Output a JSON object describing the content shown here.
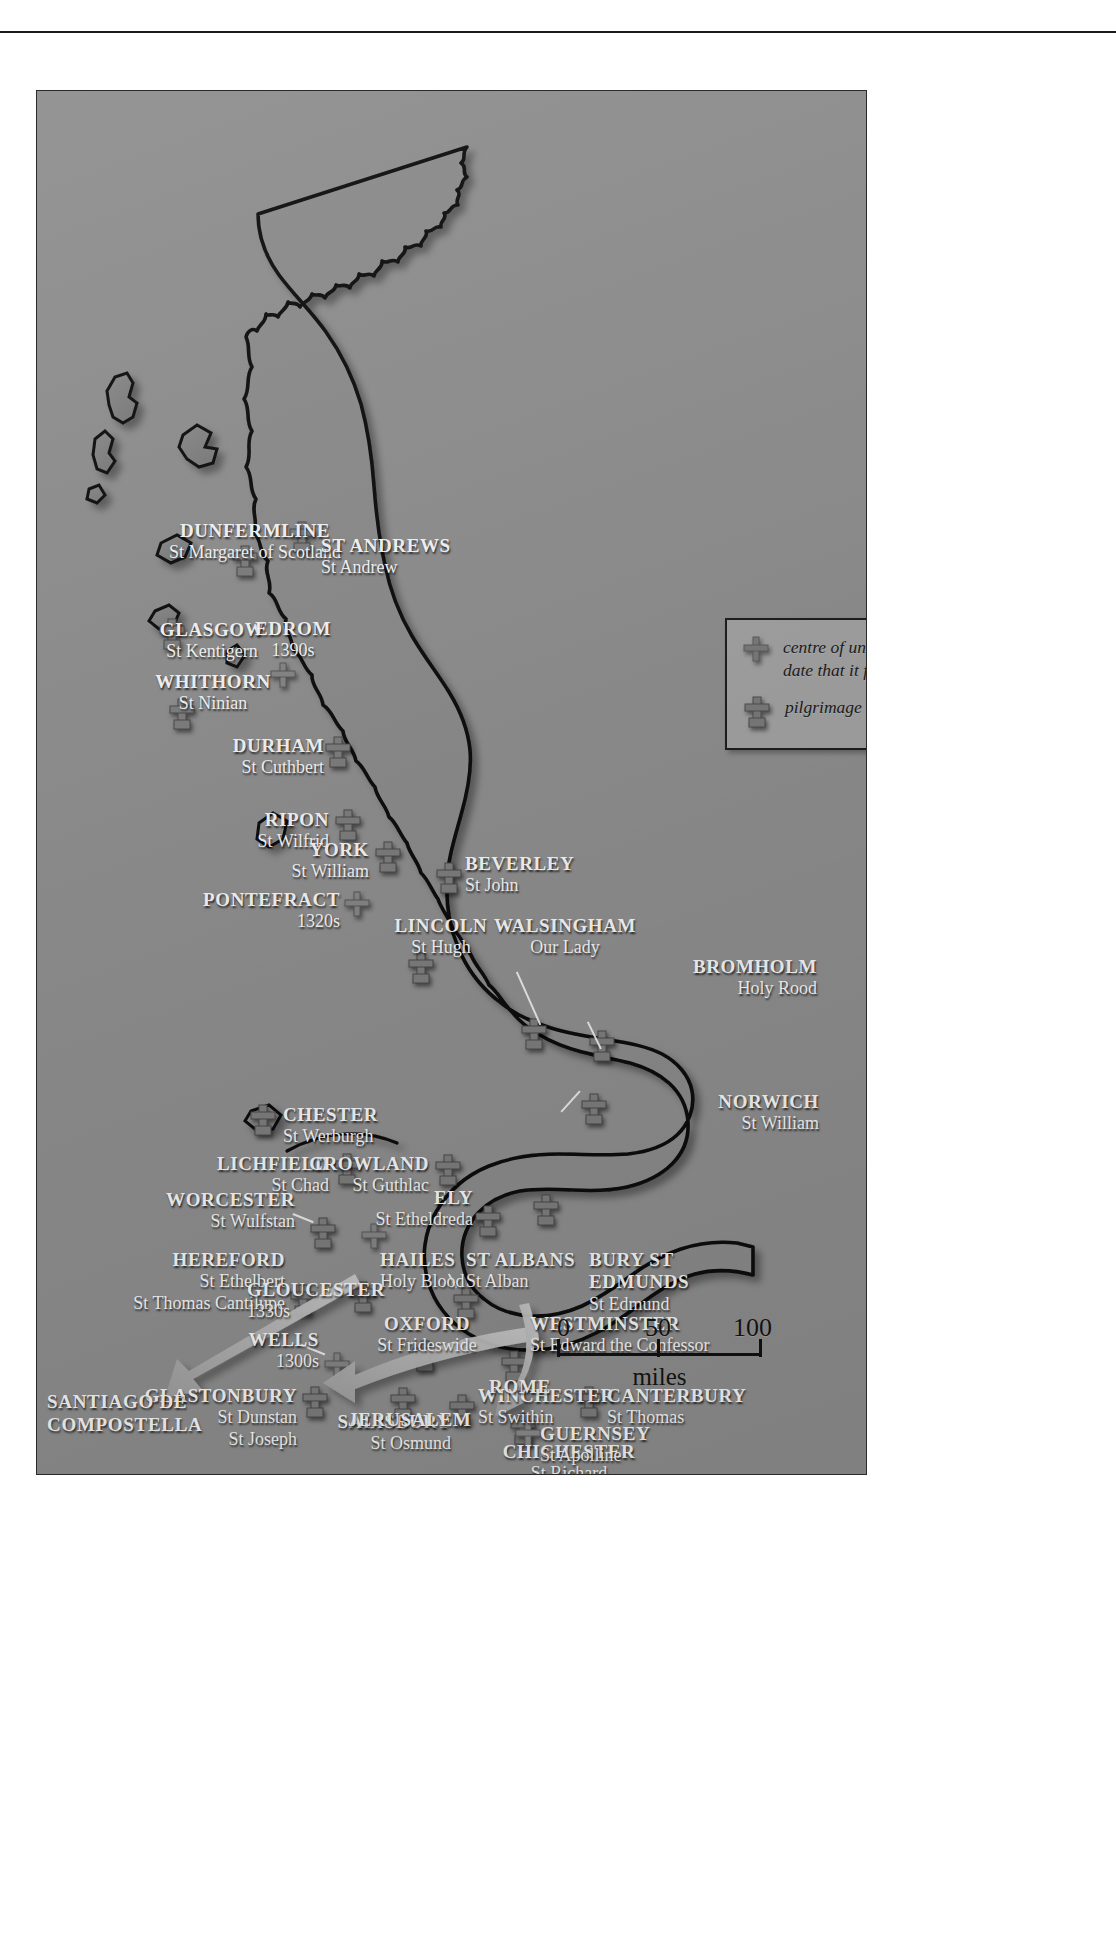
{
  "map": {
    "title": "Pilgrimage and cult centres of medieval Britain",
    "background_color": "#8e8e8e",
    "land_color": "#949494",
    "scotland_color": "#7f7f7f",
    "label_color": "#f4f4f4",
    "outline_color": "#111111"
  },
  "legend": {
    "entries": [
      {
        "icon": "plain-cross-icon",
        "text_line1": "centre of unofficial cult with",
        "text_line2": "date that it flourished"
      },
      {
        "icon": "pilgrimage-cross-icon",
        "text_line1": "pilgrimage centre",
        "text_line2": ""
      }
    ]
  },
  "scale": {
    "ticks": [
      "0",
      "50",
      "100"
    ],
    "unit": "miles"
  },
  "routes": [
    {
      "name": "santiago",
      "label_line1": "SANTIAGO DE",
      "label_line2": "COMPOSTELLA"
    },
    {
      "name": "jerusalem",
      "label_line1": "JERUSALEM",
      "label_line2": ""
    },
    {
      "name": "rome",
      "label_line1": "ROME",
      "label_line2": ""
    }
  ],
  "places": [
    {
      "id": "dunfermline",
      "town": "DUNFERMLINE",
      "saint": "St Margaret of Scotland",
      "type": "pilgrimage"
    },
    {
      "id": "st-andrews",
      "town": "ST ANDREWS",
      "saint": "St Andrew",
      "type": "pilgrimage"
    },
    {
      "id": "glasgow",
      "town": "GLASGOW",
      "saint": "St Kentigern",
      "type": "pilgrimage"
    },
    {
      "id": "edrom",
      "town": "EDROM",
      "saint": "1390s",
      "type": "unofficial"
    },
    {
      "id": "whithorn",
      "town": "WHITHORN",
      "saint": "St Ninian",
      "type": "pilgrimage"
    },
    {
      "id": "durham",
      "town": "DURHAM",
      "saint": "St Cuthbert",
      "type": "pilgrimage"
    },
    {
      "id": "ripon",
      "town": "RIPON",
      "saint": "St Wilfrid",
      "type": "pilgrimage"
    },
    {
      "id": "york",
      "town": "YORK",
      "saint": "St William",
      "type": "pilgrimage"
    },
    {
      "id": "beverley",
      "town": "BEVERLEY",
      "saint": "St John",
      "type": "pilgrimage"
    },
    {
      "id": "pontefract",
      "town": "PONTEFRACT",
      "saint": "1320s",
      "type": "unofficial"
    },
    {
      "id": "lincoln",
      "town": "LINCOLN",
      "saint": "St Hugh",
      "type": "pilgrimage"
    },
    {
      "id": "walsingham",
      "town": "WALSINGHAM",
      "saint": "Our Lady",
      "type": "pilgrimage"
    },
    {
      "id": "bromholm",
      "town": "BROMHOLM",
      "saint": "Holy Rood",
      "type": "pilgrimage"
    },
    {
      "id": "chester",
      "town": "CHESTER",
      "saint": "St Werburgh",
      "type": "pilgrimage"
    },
    {
      "id": "lichfield",
      "town": "LICHFIELD",
      "saint": "St Chad",
      "type": "pilgrimage"
    },
    {
      "id": "crowland",
      "town": "CROWLAND",
      "saint": "St Guthlac",
      "type": "pilgrimage"
    },
    {
      "id": "norwich",
      "town": "NORWICH",
      "saint": "St William",
      "type": "pilgrimage"
    },
    {
      "id": "worcester",
      "town": "WORCESTER",
      "saint": "St Wulfstan",
      "type": "pilgrimage"
    },
    {
      "id": "ely",
      "town": "ELY",
      "saint": "St Etheldreda",
      "type": "pilgrimage"
    },
    {
      "id": "hereford",
      "town": "HEREFORD",
      "saint": "St Ethelbert",
      "saint2": "St Thomas Cantilupe",
      "type": "pilgrimage"
    },
    {
      "id": "hailes",
      "town": "HAILES",
      "saint": "Holy Blood",
      "type": "pilgrimage"
    },
    {
      "id": "st-albans",
      "town": "ST ALBANS",
      "saint": "St Alban",
      "type": "pilgrimage"
    },
    {
      "id": "bury",
      "town": "BURY ST",
      "town2": "EDMUNDS",
      "saint": "St Edmund",
      "type": "pilgrimage"
    },
    {
      "id": "gloucester",
      "town": "GLOUCESTER",
      "saint": "1330s",
      "type": "unofficial"
    },
    {
      "id": "oxford",
      "town": "OXFORD",
      "saint": "St Frideswide",
      "type": "pilgrimage"
    },
    {
      "id": "westminster",
      "town": "WESTMINSTER",
      "saint": "St Edward the Confessor",
      "type": "pilgrimage"
    },
    {
      "id": "wells",
      "town": "WELLS",
      "saint": "1300s",
      "type": "unofficial"
    },
    {
      "id": "glastonbury",
      "town": "GLASTONBURY",
      "saint": "St Dunstan",
      "saint2": "St Joseph",
      "type": "pilgrimage"
    },
    {
      "id": "winchester",
      "town": "WINCHESTER",
      "saint": "St Swithin",
      "type": "pilgrimage"
    },
    {
      "id": "canterbury",
      "town": "CANTERBURY",
      "saint": "St Thomas",
      "type": "pilgrimage"
    },
    {
      "id": "salisbury",
      "town": "SALISBURY",
      "saint": "St Osmund",
      "type": "pilgrimage"
    },
    {
      "id": "chichester",
      "town": "CHICHESTER",
      "saint": "St Richard",
      "type": "pilgrimage"
    },
    {
      "id": "guernsey",
      "town": "GUERNSEY",
      "saint": "St Apolline",
      "type": "unofficial"
    }
  ]
}
